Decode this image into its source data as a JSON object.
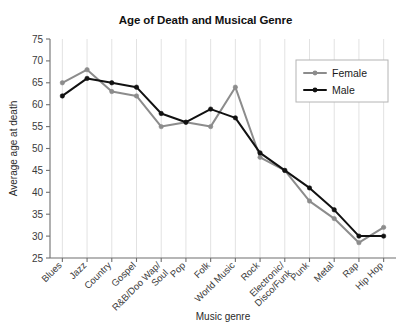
{
  "chart_data": {
    "type": "line",
    "title": "Age of Death and Musical Genre",
    "xlabel": "Music genre",
    "ylabel": "Average age at death",
    "ylim": [
      25,
      75
    ],
    "ytick_step": 5,
    "yticks": [
      "75",
      "70",
      "65",
      "60",
      "55",
      "50",
      "45",
      "40",
      "35",
      "30",
      "25"
    ],
    "grid": "vertical",
    "legend_position": "top-right",
    "categories": [
      "Blues",
      "Jazz",
      "Country",
      "Gospel",
      "R&B/Doo Wap/\nSoul",
      "Pop",
      "Folk",
      "World Music",
      "Rock",
      "Electronic/\nDisco/Funk",
      "Punk",
      "Metal",
      "Rap",
      "Hip Hop"
    ],
    "series": [
      {
        "name": "Female",
        "color": "#8c8c8c",
        "values": [
          65,
          68,
          63,
          62,
          55,
          56,
          55,
          64,
          48,
          45,
          38,
          34,
          28.5,
          32
        ]
      },
      {
        "name": "Male",
        "color": "#111111",
        "values": [
          62,
          66,
          65,
          64,
          58,
          56,
          59,
          57,
          49,
          45,
          41,
          36,
          30,
          30
        ]
      }
    ]
  }
}
